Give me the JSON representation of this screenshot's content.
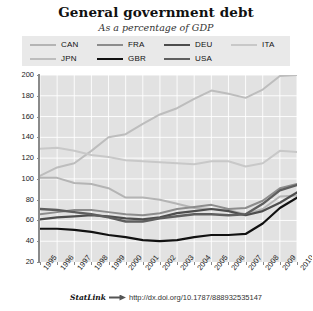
{
  "title": "General government debt",
  "subtitle": "As a percentage of GDP",
  "footer": {
    "statlink_label": "StatLink",
    "arrow_icon": "arrow-right-icon",
    "url": "http://dx.doi.org/10.1787/888932535147"
  },
  "legend": {
    "items": [
      {
        "label": "CAN",
        "color": "#b4b4b4",
        "width": 1.7
      },
      {
        "label": "FRA",
        "color": "#8c8c8c",
        "width": 1.7
      },
      {
        "label": "DEU",
        "color": "#4d4d4d",
        "width": 1.9
      },
      {
        "label": "ITA",
        "color": "#c8c8c8",
        "width": 1.7
      },
      {
        "label": "JPN",
        "color": "#bdbdbd",
        "width": 1.7
      },
      {
        "label": "GBR",
        "color": "#111111",
        "width": 1.9
      },
      {
        "label": "USA",
        "color": "#5e5e5e",
        "width": 2.1
      }
    ]
  },
  "chart_data": {
    "type": "line",
    "title": "General government debt",
    "subtitle": "As a percentage of GDP",
    "xlabel": "",
    "ylabel": "",
    "ylim": [
      20,
      200
    ],
    "yticks": [
      20,
      40,
      60,
      80,
      100,
      120,
      140,
      160,
      180,
      200
    ],
    "grid": true,
    "legend_position": "top",
    "x": [
      1995,
      1996,
      1997,
      1998,
      1999,
      2000,
      2001,
      2002,
      2003,
      2004,
      2005,
      2006,
      2007,
      2008,
      2009,
      2010
    ],
    "xticklabels": [
      "1995",
      "1996",
      "1997",
      "1998",
      "1999",
      "2000",
      "2001",
      "2002",
      "2003",
      "2004",
      "2005",
      "2006",
      "2007",
      "2008",
      "2009",
      "2010"
    ],
    "series": [
      {
        "name": "JPN",
        "color": "#bdbdbd",
        "values": [
          103,
          111,
          115,
          127,
          140,
          143,
          153,
          162,
          168,
          177,
          185,
          182,
          178,
          186,
          199,
          200
        ]
      },
      {
        "name": "ITA",
        "color": "#c8c8c8",
        "values": [
          129,
          130,
          127,
          123,
          121,
          118,
          117,
          116,
          115,
          114,
          117,
          117,
          112,
          115,
          127,
          126
        ]
      },
      {
        "name": "CAN",
        "color": "#b4b4b4",
        "values": [
          101,
          101,
          96,
          95,
          91,
          82,
          82,
          80,
          76,
          72,
          71,
          70,
          66,
          71,
          83,
          84
        ]
      },
      {
        "name": "FRA",
        "color": "#8c8c8c",
        "values": [
          66,
          68,
          70,
          70,
          68,
          66,
          65,
          67,
          71,
          73,
          75,
          71,
          72,
          79,
          91,
          95
        ]
      },
      {
        "name": "DEU",
        "color": "#4d4d4d",
        "values": [
          61,
          63,
          64,
          65,
          64,
          62,
          61,
          63,
          67,
          69,
          71,
          69,
          65,
          69,
          77,
          87
        ]
      },
      {
        "name": "USA",
        "color": "#5e5e5e",
        "values": [
          71,
          70,
          68,
          66,
          63,
          59,
          59,
          62,
          64,
          66,
          66,
          65,
          66,
          76,
          89,
          94
        ]
      },
      {
        "name": "GBR",
        "color": "#111111",
        "values": [
          52,
          52,
          51,
          49,
          46,
          44,
          41,
          40,
          41,
          44,
          46,
          46,
          47,
          57,
          72,
          82
        ]
      }
    ]
  }
}
